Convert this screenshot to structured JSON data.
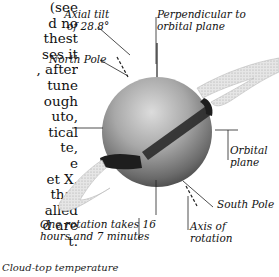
{
  "body_text_lines": [
    "(see",
    "d no",
    "thest",
    "ses it",
    ", after",
    "tune",
    "ough",
    "uto,",
    "tical",
    "te,",
    "e",
    "et X.",
    " that",
    "alled",
    "d are",
    "t."
  ],
  "labels": {
    "axial_tilt": [
      "Axial tilt",
      "of 28.8°"
    ],
    "perpendicular": [
      "Perpendicular to",
      "orbital plane"
    ],
    "north_pole": "North Pole",
    "orbital_plane": [
      "Orbital",
      "plane"
    ],
    "south_pole": "South Pole",
    "rotation": [
      "One rotation takes 16",
      "hours and 7 minutes"
    ],
    "axis_of_rotation": [
      "Axis of",
      "rotation"
    ]
  },
  "caption": "Cloud-top temperature",
  "colors": {
    "planet_light": "#d8d8d8",
    "planet_mid": "#9a9a9a",
    "planet_dark": "#4a4a4a",
    "band": "#2a2a2a",
    "ring": "#cfcfcf",
    "line": "#222222"
  }
}
